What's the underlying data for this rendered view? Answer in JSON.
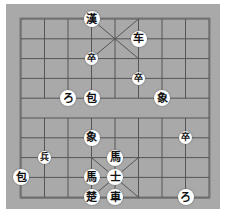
{
  "game": "xiangqi",
  "board": {
    "columns": 9,
    "rows": 10,
    "background": "#a9a9a9",
    "line_color": "#555555"
  },
  "pieces": [
    {
      "glyph": "漢",
      "type": "general",
      "side": "black",
      "col": 3,
      "row": 0
    },
    {
      "glyph": "车",
      "type": "chariot",
      "side": "black",
      "col": 5,
      "row": 1
    },
    {
      "glyph": "卒",
      "type": "soldier",
      "side": "black",
      "col": 3,
      "row": 2,
      "small": true
    },
    {
      "glyph": "卒",
      "type": "soldier",
      "side": "black",
      "col": 5,
      "row": 3,
      "small": true
    },
    {
      "glyph": "ろ",
      "type": "horse",
      "side": "black",
      "col": 2,
      "row": 4
    },
    {
      "glyph": "包",
      "type": "cannon",
      "side": "black",
      "col": 3,
      "row": 4
    },
    {
      "glyph": "象",
      "type": "elephant",
      "side": "black",
      "col": 6,
      "row": 4
    },
    {
      "glyph": "象",
      "type": "elephant",
      "side": "red",
      "col": 3,
      "row": 6
    },
    {
      "glyph": "卒",
      "type": "soldier",
      "side": "black",
      "col": 7,
      "row": 6,
      "small": true
    },
    {
      "glyph": "兵",
      "type": "soldier",
      "side": "red",
      "col": 1,
      "row": 7,
      "small": true
    },
    {
      "glyph": "馬",
      "type": "horse",
      "side": "red",
      "col": 4,
      "row": 7
    },
    {
      "glyph": "包",
      "type": "cannon",
      "side": "red",
      "col": 0,
      "row": 8
    },
    {
      "glyph": "馬",
      "type": "horse",
      "side": "red",
      "col": 3,
      "row": 8
    },
    {
      "glyph": "士",
      "type": "advisor",
      "side": "red",
      "col": 4,
      "row": 8
    },
    {
      "glyph": "楚",
      "type": "general",
      "side": "red",
      "col": 3,
      "row": 9
    },
    {
      "glyph": "車",
      "type": "chariot",
      "side": "red",
      "col": 4,
      "row": 9
    },
    {
      "glyph": "ろ",
      "type": "horse",
      "side": "red",
      "col": 7,
      "row": 9
    }
  ]
}
